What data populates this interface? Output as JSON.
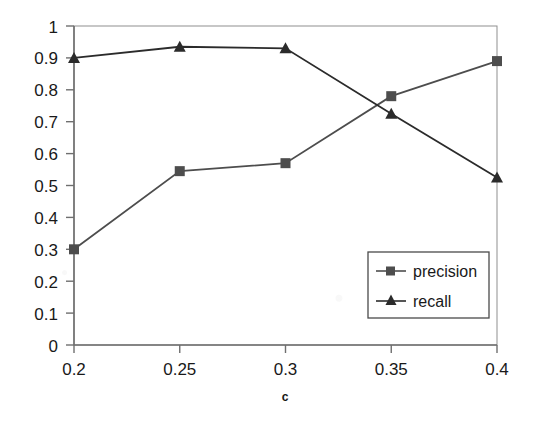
{
  "chart_data": {
    "type": "line",
    "title": "",
    "xlabel": "c",
    "ylabel": "",
    "categories": [
      "0.2",
      "0.25",
      "0.3",
      "0.35",
      "0.4"
    ],
    "x": [
      0.2,
      0.25,
      0.3,
      0.35,
      0.4
    ],
    "series": [
      {
        "name": "precision",
        "marker": "square",
        "color": "#4d4d4d",
        "values": [
          0.3,
          0.545,
          0.57,
          0.78,
          0.89
        ]
      },
      {
        "name": "recall",
        "marker": "triangle",
        "color": "#2b2b2b",
        "values": [
          0.9,
          0.935,
          0.93,
          0.725,
          0.525
        ]
      }
    ],
    "ylim": [
      0,
      1
    ],
    "ytick_labels": [
      "0",
      "0.1",
      "0.2",
      "0.3",
      "0.4",
      "0.5",
      "0.6",
      "0.7",
      "0.8",
      "0.9",
      "1"
    ],
    "ytick_values": [
      0,
      0.1,
      0.2,
      0.3,
      0.4,
      0.5,
      0.6,
      0.7,
      0.8,
      0.9,
      1
    ],
    "xtick_labels": [
      "0.2",
      "0.25",
      "0.3",
      "0.35",
      "0.4"
    ],
    "grid": false,
    "legend_position": "inside-lower-right",
    "legend_entries": [
      "precision",
      "recall"
    ]
  },
  "plot": {
    "frame_color": "#8a8a8a",
    "axis_color": "#6f6f6f"
  }
}
